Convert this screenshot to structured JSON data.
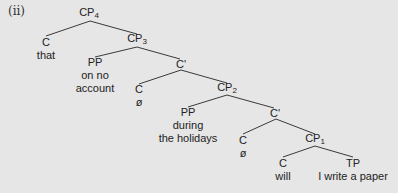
{
  "diagram": {
    "label": "(ii)",
    "nodes": [
      {
        "id": "cp4",
        "cat": "CP",
        "sub": "4",
        "words": []
      },
      {
        "id": "c_that",
        "cat": "C",
        "sub": "",
        "words": [
          "that"
        ]
      },
      {
        "id": "cp3",
        "cat": "CP",
        "sub": "3",
        "words": []
      },
      {
        "id": "pp1",
        "cat": "PP",
        "sub": "",
        "words": [
          "on no",
          "account"
        ]
      },
      {
        "id": "cbar1",
        "cat": "C'",
        "sub": "",
        "words": []
      },
      {
        "id": "c_null1",
        "cat": "C",
        "sub": "",
        "words": [
          "ø"
        ]
      },
      {
        "id": "cp2",
        "cat": "CP",
        "sub": "2",
        "words": []
      },
      {
        "id": "pp2",
        "cat": "PP",
        "sub": "",
        "words": [
          "during",
          "the holidays"
        ]
      },
      {
        "id": "cbar2",
        "cat": "C'",
        "sub": "",
        "words": []
      },
      {
        "id": "c_null2",
        "cat": "C",
        "sub": "",
        "words": [
          "ø"
        ]
      },
      {
        "id": "cp1",
        "cat": "CP",
        "sub": "1",
        "words": []
      },
      {
        "id": "c_will",
        "cat": "C",
        "sub": "",
        "words": [
          "will"
        ]
      },
      {
        "id": "tp",
        "cat": "TP",
        "sub": "",
        "words": [
          "I write a paper"
        ]
      }
    ],
    "edges": [
      [
        "cp4",
        "c_that"
      ],
      [
        "cp4",
        "cp3"
      ],
      [
        "cp3",
        "pp1"
      ],
      [
        "cp3",
        "cbar1"
      ],
      [
        "cbar1",
        "c_null1"
      ],
      [
        "cbar1",
        "cp2"
      ],
      [
        "cp2",
        "pp2"
      ],
      [
        "cp2",
        "cbar2"
      ],
      [
        "cbar2",
        "c_null2"
      ],
      [
        "cbar2",
        "cp1"
      ],
      [
        "cp1",
        "c_will"
      ],
      [
        "cp1",
        "tp"
      ]
    ]
  }
}
